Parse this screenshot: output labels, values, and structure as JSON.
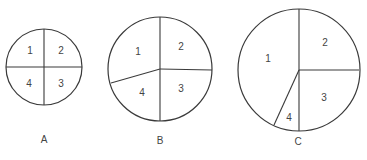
{
  "diagrams": [
    {
      "caption": "A",
      "center": [
        44,
        67
      ],
      "radius": 38,
      "dividers": [
        [
          44,
          29
        ],
        [
          82,
          67
        ],
        [
          44,
          105
        ],
        [
          6,
          67
        ]
      ],
      "segments": [
        {
          "label": "1",
          "pos": [
            30,
            51
          ]
        },
        {
          "label": "2",
          "pos": [
            61,
            51
          ]
        },
        {
          "label": "3",
          "pos": [
            61,
            84
          ]
        },
        {
          "label": "4",
          "pos": [
            29,
            84
          ]
        }
      ],
      "caption_pos": [
        44,
        140
      ]
    },
    {
      "caption": "B",
      "center": [
        160,
        69
      ],
      "radius": 52,
      "dividers": [
        [
          160,
          17
        ],
        [
          212,
          70
        ],
        [
          160,
          121
        ],
        [
          111,
          83
        ]
      ],
      "segments": [
        {
          "label": "1",
          "pos": [
            138,
            52
          ]
        },
        {
          "label": "2",
          "pos": [
            181,
            47
          ]
        },
        {
          "label": "3",
          "pos": [
            181,
            89
          ]
        },
        {
          "label": "4",
          "pos": [
            142,
            93
          ]
        }
      ],
      "caption_pos": [
        160,
        141
      ]
    },
    {
      "caption": "C",
      "center": [
        299,
        70
      ],
      "radius": 61,
      "dividers": [
        [
          299,
          9
        ],
        [
          359,
          70
        ],
        [
          299,
          131
        ],
        [
          274,
          125
        ]
      ],
      "segments": [
        {
          "label": "1",
          "pos": [
            268,
            59
          ]
        },
        {
          "label": "2",
          "pos": [
            325,
            43
          ]
        },
        {
          "label": "3",
          "pos": [
            324,
            98
          ]
        },
        {
          "label": "4",
          "pos": [
            289,
            118
          ]
        }
      ],
      "caption_pos": [
        298,
        142
      ]
    }
  ]
}
